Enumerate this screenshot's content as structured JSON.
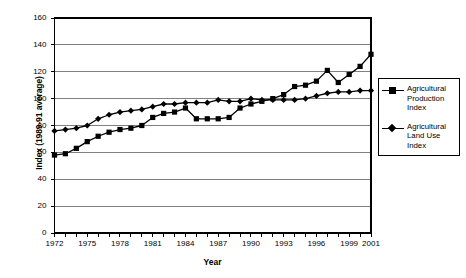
{
  "chart_data": {
    "type": "line",
    "title": "",
    "xlabel": "Year",
    "ylabel": "Index (1989-91 average)",
    "xlim": [
      1972,
      2001
    ],
    "ylim": [
      0,
      160
    ],
    "grid": "horizontal",
    "legend_position": "right-outside",
    "y_ticks": [
      160,
      140,
      120,
      100,
      80,
      60,
      40,
      20,
      0
    ],
    "x_ticks_labeled": [
      1972,
      1975,
      1978,
      1981,
      1984,
      1987,
      1990,
      1993,
      1996,
      1999,
      2001
    ],
    "x": [
      1972,
      1973,
      1974,
      1975,
      1976,
      1977,
      1978,
      1979,
      1980,
      1981,
      1982,
      1983,
      1984,
      1985,
      1986,
      1987,
      1988,
      1989,
      1990,
      1991,
      1992,
      1993,
      1994,
      1995,
      1996,
      1997,
      1998,
      1999,
      2000,
      2001
    ],
    "series": [
      {
        "name": "Agricultural Production Index",
        "marker": "square",
        "values": [
          58,
          59,
          63,
          68,
          72,
          75,
          77,
          78,
          80,
          86,
          89,
          90,
          93,
          85,
          85,
          85,
          86,
          93,
          96,
          98,
          100,
          103,
          109,
          110,
          113,
          121,
          112,
          118,
          124,
          133
        ]
      },
      {
        "name": "Agricultural Land Use Index",
        "marker": "diamond",
        "values": [
          76,
          77,
          78,
          80,
          85,
          88,
          90,
          91,
          92,
          94,
          96,
          96,
          97,
          97,
          97,
          99,
          98,
          98,
          100,
          99,
          99,
          99,
          99,
          100,
          102,
          104,
          105,
          105,
          106,
          106
        ]
      }
    ]
  },
  "legend": {
    "items": [
      {
        "label_line1": "Agricultural",
        "label_line2": "Production",
        "label_line3": "Index",
        "marker": "square"
      },
      {
        "label_line1": "Agricultural",
        "label_line2": "Land Use",
        "label_line3": "Index",
        "marker": "diamond"
      }
    ]
  },
  "axis_titles": {
    "x": "Year",
    "y": "Index (1989-91 average)"
  },
  "colors": {
    "series": "#000000",
    "grid": "#808080",
    "axis": "#000000",
    "background": "#ffffff"
  }
}
